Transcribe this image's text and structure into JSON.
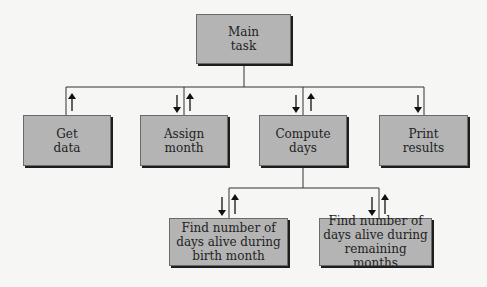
{
  "diagram": {
    "type": "structure-chart",
    "root": {
      "label_line1": "Main",
      "label_line2": "task"
    },
    "level1": [
      {
        "id": "get-data",
        "line1": "Get",
        "line2": "data",
        "flows": [
          "up"
        ]
      },
      {
        "id": "assign-month",
        "line1": "Assign",
        "line2": "month",
        "flows": [
          "down",
          "up"
        ]
      },
      {
        "id": "compute-days",
        "line1": "Compute",
        "line2": "days",
        "flows": [
          "down",
          "up"
        ]
      },
      {
        "id": "print-results",
        "line1": "Print",
        "line2": "results",
        "flows": [
          "down"
        ]
      }
    ],
    "level2": [
      {
        "id": "birth-month",
        "line1": "Find number of",
        "line2": "days alive during",
        "line3": "birth month",
        "flows": [
          "down",
          "up"
        ]
      },
      {
        "id": "remaining-months",
        "line1": "Find number of",
        "line2": "days alive during",
        "line3": "remaining months",
        "flows": [
          "down",
          "up"
        ]
      }
    ],
    "colors": {
      "box_fill": "#b4b4b4",
      "shadow": "#1e1e1e",
      "line": "#333333",
      "background": "#f6f6f4"
    }
  }
}
